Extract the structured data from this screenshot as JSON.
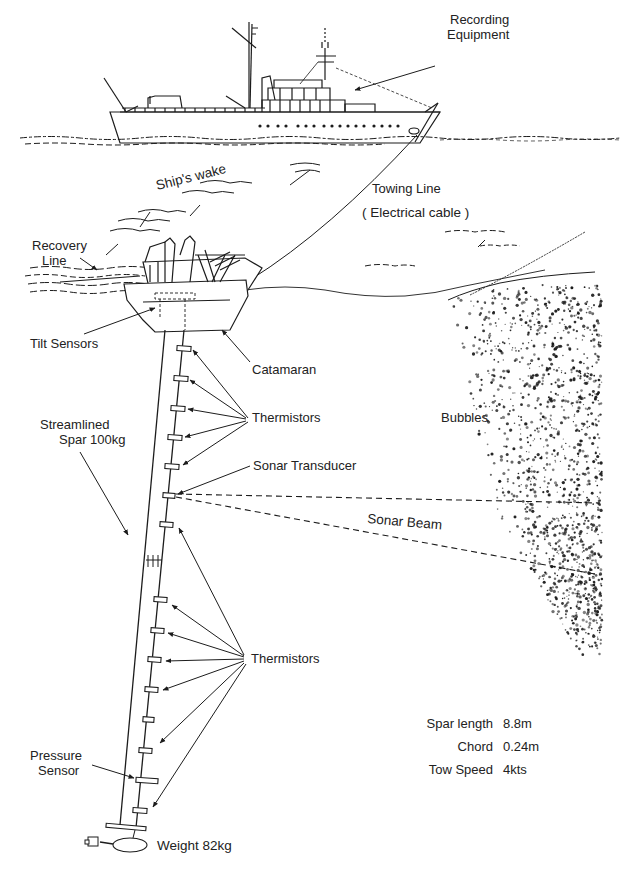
{
  "diagram": {
    "labels": {
      "recording_equipment": [
        "Recording",
        "Equipment"
      ],
      "ships_wake": "Ship's wake",
      "towing_line": "Towing Line",
      "electrical_cable": "( Electrical cable )",
      "recovery_line": [
        "Recovery",
        "Line"
      ],
      "tilt_sensors": "Tilt Sensors",
      "catamaran": "Catamaran",
      "thermistors_upper": "Thermistors",
      "streamlined_spar": [
        "Streamlined",
        "Spar 100kg"
      ],
      "bubbles": "Bubbles",
      "sonar_transducer": "Sonar Transducer",
      "sonar_beam": "Sonar Beam",
      "thermistors_lower": "Thermistors",
      "pressure_sensor": [
        "Pressure",
        "Sensor"
      ],
      "weight": "Weight  82kg"
    },
    "specs": [
      {
        "key": "Spar  length",
        "value": "8.8m"
      },
      {
        "key": "Chord",
        "value": "0.24m"
      },
      {
        "key": "Tow Speed",
        "value": "4kts"
      }
    ],
    "colors": {
      "ink": "#1c1c1c",
      "background": "#ffffff"
    }
  }
}
